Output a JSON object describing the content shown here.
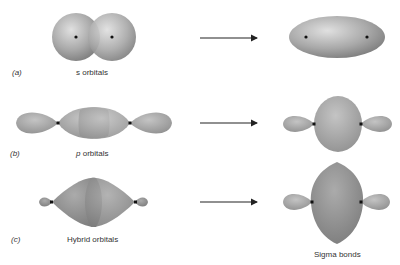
{
  "diagram": {
    "rows": [
      {
        "id": "a",
        "part_label": "(a)",
        "letter": "a",
        "left_label": "s orbitals",
        "left_italic_prefix": "",
        "result_label": ""
      },
      {
        "id": "b",
        "part_label": "(b)",
        "letter": "b",
        "left_label": " orbitals",
        "left_italic_prefix": "p",
        "result_label": ""
      },
      {
        "id": "c",
        "part_label": "(c)",
        "letter": "c",
        "left_label": "Hybrid orbitals",
        "left_italic_prefix": "",
        "result_label": "Sigma bonds"
      }
    ],
    "colors": {
      "orbital_light": "#d8d8d8",
      "orbital_mid": "#a8a8a8",
      "orbital_dark": "#7a7a7a",
      "nucleus": "#111111",
      "arrow": "#222222",
      "text": "#333333"
    }
  }
}
